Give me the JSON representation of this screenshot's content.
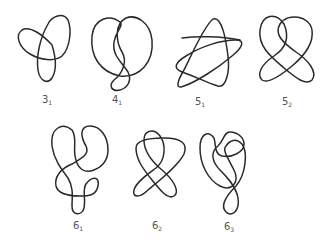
{
  "diagram": {
    "title": "",
    "stroke_color": "#2a2a2a",
    "background": "#ffffff",
    "knots": [
      {
        "id": "3_1",
        "crossing_number": "3",
        "index": "1",
        "label_x": 47,
        "label_y": 95
      },
      {
        "id": "4_1",
        "crossing_number": "4",
        "index": "1",
        "label_x": 117,
        "label_y": 95
      },
      {
        "id": "5_1",
        "crossing_number": "5",
        "index": "1",
        "label_x": 200,
        "label_y": 97
      },
      {
        "id": "5_2",
        "crossing_number": "5",
        "index": "2",
        "label_x": 287,
        "label_y": 97
      },
      {
        "id": "6_1",
        "crossing_number": "6",
        "index": "1",
        "label_x": 78,
        "label_y": 221
      },
      {
        "id": "6_2",
        "crossing_number": "6",
        "index": "2",
        "label_x": 157,
        "label_y": 221
      },
      {
        "id": "6_3",
        "crossing_number": "6",
        "index": "3",
        "label_x": 229,
        "label_y": 222
      }
    ]
  }
}
